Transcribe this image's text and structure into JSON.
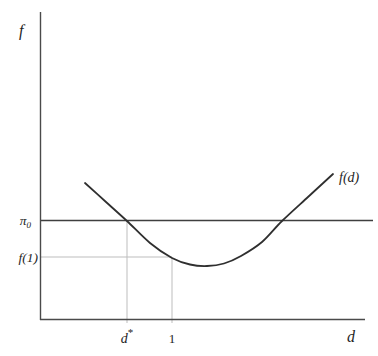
{
  "labels": {
    "f_axis": "f",
    "pi0_base": "π",
    "pi0_sub": "0",
    "f1": "f(1)",
    "dstar_base": "d",
    "dstar_sup": "*",
    "one": "1",
    "d_axis": "d",
    "fd": "f(d)"
  },
  "colors": {
    "background": "#ffffff",
    "axis": "#4a4a4a",
    "curve": "#2f2f2f",
    "reference_line": "#3f3f3f",
    "guide": "#bdbdbd",
    "text": "#1e1e1e"
  },
  "chart_data": {
    "type": "line",
    "title": "",
    "xlabel": "d",
    "ylabel": "f",
    "x_tick_labels": [
      "d*",
      "1"
    ],
    "y_tick_labels": [
      "π0",
      "f(1)"
    ],
    "legend": "none",
    "grid": false,
    "axes_note": "No numeric scale shown except the tick value 1 on the d axis.",
    "d_axis_mapping_px": {
      "d0_x": 40,
      "d1_x": 172
    },
    "key_values_estimated": {
      "d_star": 0.66,
      "curve_domain_d": [
        0.34,
        2.22
      ]
    },
    "key_points_px": {
      "d_star_x": 127,
      "one_x": 172,
      "pi0_y": 220.5,
      "f1_y": 257
    },
    "series": [
      {
        "name": "f(d)",
        "points_px": [
          [
            85,
            183
          ],
          [
            106,
            202
          ],
          [
            127,
            221
          ],
          [
            150,
            243
          ],
          [
            172,
            258
          ],
          [
            190,
            264.5
          ],
          [
            207,
            266
          ],
          [
            224,
            263.5
          ],
          [
            241,
            256
          ],
          [
            262,
            242
          ],
          [
            282,
            221
          ],
          [
            308,
            197
          ],
          [
            333,
            174
          ]
        ]
      }
    ],
    "geometry_px": {
      "y_axis": {
        "x1": 40.5,
        "y1": 12,
        "x2": 40.5,
        "y2": 320
      },
      "x_axis": {
        "x1": 40,
        "y1": 319.5,
        "x2": 365,
        "y2": 319.5
      },
      "pi0_line": {
        "x1": 41,
        "y1": 220.5,
        "x2": 373,
        "y2": 220.5
      },
      "f1_guide": {
        "x1": 41,
        "y1": 257,
        "x2": 172,
        "y2": 257
      },
      "dstar_guide": {
        "x1": 127,
        "y1": 221,
        "x2": 127,
        "y2": 323
      },
      "one_guide": {
        "x1": 172,
        "y1": 258,
        "x2": 172,
        "y2": 323
      }
    }
  }
}
